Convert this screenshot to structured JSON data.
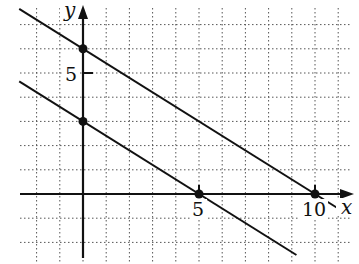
{
  "chart_data": {
    "type": "line",
    "title": "",
    "xlabel": "x",
    "ylabel": "y",
    "xlim": [
      -3,
      11.5
    ],
    "ylim": [
      -2.5,
      8
    ],
    "grid": true,
    "grid_style": "dotted",
    "x_ticks": [
      5,
      10
    ],
    "x_tick_labels": [
      "5",
      "10"
    ],
    "y_ticks": [
      5
    ],
    "y_tick_labels": [
      "5"
    ],
    "series": [
      {
        "name": "upper line",
        "equation": "3x + 5y = 30",
        "points": [
          [
            0,
            6
          ],
          [
            10,
            0
          ]
        ],
        "slope": -0.6,
        "y_intercept": 6,
        "x_intercept": 10
      },
      {
        "name": "lower line",
        "equation": "3x + 5y = 15",
        "points": [
          [
            0,
            3
          ],
          [
            5,
            0
          ]
        ],
        "slope": -0.6,
        "y_intercept": 3,
        "x_intercept": 5
      }
    ],
    "marked_points": [
      [
        0,
        6
      ],
      [
        0,
        3
      ],
      [
        5,
        0
      ],
      [
        10,
        0
      ]
    ],
    "colors": {
      "line": "#111111",
      "grid": "#555555",
      "background": "#ffffff"
    }
  },
  "axes": {
    "x_label": "x",
    "y_label": "y",
    "x_tick_5": "5",
    "x_tick_10": "10",
    "y_tick_5": "5"
  }
}
